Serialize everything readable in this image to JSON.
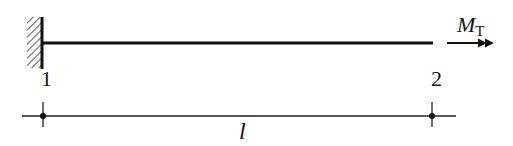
{
  "diagram": {
    "type": "cantilever-beam-torsion",
    "beam": {
      "support": "fixed-wall",
      "support_side": "left"
    },
    "nodes": [
      {
        "id": "1",
        "label": "1"
      },
      {
        "id": "2",
        "label": "2"
      }
    ],
    "load": {
      "symbol_main": "M",
      "symbol_sub": "T",
      "kind": "torque-double-arrow",
      "direction": "right"
    },
    "dimension": {
      "label": "l"
    },
    "colors": {
      "line": "#111111",
      "background": "#ffffff"
    }
  }
}
